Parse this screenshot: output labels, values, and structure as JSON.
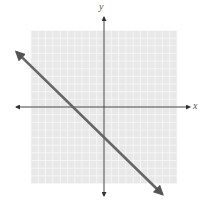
{
  "chart_data": {
    "type": "line",
    "title": "",
    "xlabel": "x",
    "ylabel": "y",
    "xlim": [
      -10,
      10
    ],
    "ylim": [
      -10,
      10
    ],
    "grid": true,
    "grid_step": 1,
    "tick_labels": false,
    "legend": null,
    "series": [
      {
        "name": "line",
        "equation": "y = -x - 4",
        "slope": -1,
        "intercept": -4,
        "x_intercept": -4,
        "y_intercept": -4,
        "x": [
          -12,
          8
        ],
        "y": [
          8,
          -12
        ],
        "arrows": "both"
      }
    ]
  },
  "colors": {
    "grid_background": "#e8e8e8",
    "grid_lines": "#f8f8f8",
    "axes": "#444444",
    "line": "#666666"
  },
  "axes": {
    "x_label": "x",
    "y_label": "y"
  }
}
